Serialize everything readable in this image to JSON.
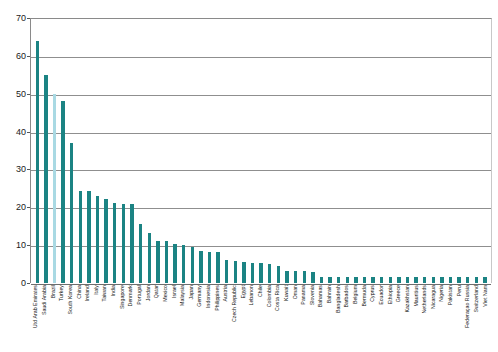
{
  "chart_data": {
    "type": "bar",
    "title": "",
    "subtitle": "",
    "xlabel": "",
    "ylabel": "",
    "ylim": [
      0,
      70
    ],
    "yticks": [
      0,
      10,
      20,
      30,
      40,
      50,
      60,
      70
    ],
    "grid": true,
    "legend": "none",
    "orientation": "vertical",
    "bar_color": "#1b8383",
    "highlight_color": "#a9d9e3",
    "highlight_category": "Brazil",
    "categories": [
      "Utd Arab Emirates",
      "Saudi Arabia",
      "Brazil",
      "Turkey",
      "South Korea",
      "China",
      "Ireland",
      "Italy",
      "Taiwan",
      "India",
      "Singapore",
      "Denmark",
      "Portugal",
      "Jordan",
      "Qatar",
      "Mexico",
      "Israel",
      "Malaysia",
      "Japan",
      "Germany",
      "Indonesia",
      "Philippines",
      "Austria",
      "Czech Republic",
      "Egypt",
      "Lebanon",
      "Chile",
      "Colombia",
      "Costa Rica",
      "Kuwait",
      "Oman",
      "Panama",
      "Slovenia",
      "Bahamas",
      "Bahrain",
      "Bangladesh",
      "Barbados",
      "Belgium",
      "Bermuda",
      "Cyprus",
      "Ecuador",
      "Ethiopia",
      "Greece",
      "Kazakhstan",
      "Mauritius",
      "Netherlands",
      "Nicaragua",
      "Nigeria",
      "Pakistan",
      "Peru",
      "Federaçao Russia",
      "Switzerland",
      "Viet Nam"
    ],
    "values": [
      64,
      55,
      50,
      48,
      37,
      24.3,
      24.2,
      23.1,
      22.3,
      21.2,
      21.0,
      20.8,
      15.5,
      13.2,
      11.2,
      11.0,
      10.2,
      10.0,
      9.6,
      8.4,
      8.2,
      8.1,
      6.0,
      5.8,
      5.5,
      5.4,
      5.2,
      5.0,
      4.4,
      3.3,
      3.2,
      3.1,
      3.0,
      1.6,
      1.6,
      1.6,
      1.6,
      1.6,
      1.6,
      1.6,
      1.6,
      1.6,
      1.6,
      1.6,
      1.6,
      1.6,
      1.6,
      1.6,
      1.6,
      1.6,
      1.6,
      1.6,
      1.6
    ],
    "series": [
      {
        "name": "value",
        "values": [
          64,
          55,
          50,
          48,
          37,
          24.3,
          24.2,
          23.1,
          22.3,
          21.2,
          21.0,
          20.8,
          15.5,
          13.2,
          11.2,
          11.0,
          10.2,
          10.0,
          9.6,
          8.4,
          8.2,
          8.1,
          6.0,
          5.8,
          5.5,
          5.4,
          5.2,
          5.0,
          4.4,
          3.3,
          3.2,
          3.1,
          3.0,
          1.6,
          1.6,
          1.6,
          1.6,
          1.6,
          1.6,
          1.6,
          1.6,
          1.6,
          1.6,
          1.6,
          1.6,
          1.6,
          1.6,
          1.6,
          1.6,
          1.6,
          1.6,
          1.6,
          1.6
        ]
      }
    ]
  }
}
